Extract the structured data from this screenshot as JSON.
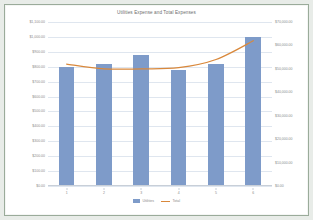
{
  "chart_data": {
    "type": "bar",
    "title": "Utilities Expense and Total Expenses",
    "xlabel": "",
    "ylabel": "",
    "categories": [
      "1",
      "2",
      "3",
      "4",
      "5",
      "6"
    ],
    "series": [
      {
        "name": "Utilities",
        "type": "bar",
        "axis": "left",
        "color": "#7e9bc9",
        "values": [
          800,
          820,
          880,
          780,
          820,
          1000
        ]
      },
      {
        "name": "Total",
        "type": "line",
        "axis": "right",
        "color": "#d9883b",
        "values": [
          52000,
          50000,
          50000,
          50500,
          54000,
          62000
        ]
      }
    ],
    "left_axis": {
      "min": 0,
      "max": 1100,
      "step": 100,
      "ticks": [
        "$1,100.00",
        "$1,000.00",
        "$900.00",
        "$800.00",
        "$700.00",
        "$600.00",
        "$500.00",
        "$400.00",
        "$300.00",
        "$200.00",
        "$100.00",
        "$0.00"
      ]
    },
    "right_axis": {
      "min": 0,
      "max": 70000,
      "step": 10000,
      "ticks": [
        "$70,000.00",
        "$60,000.00",
        "$50,000.00",
        "$40,000.00",
        "$30,000.00",
        "$20,000.00",
        "$10,000.00",
        "$0.00"
      ]
    },
    "grid": true,
    "legend_position": "bottom",
    "legend": [
      "Utilities",
      "Total"
    ]
  }
}
